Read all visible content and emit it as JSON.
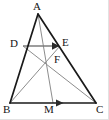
{
  "figure": {
    "type": "geometry-diagram",
    "shape": "triangle",
    "width": 109,
    "height": 120,
    "background_color": "#ffffff",
    "primary_stroke_color": "#1a1a1a",
    "secondary_stroke_color": "#8d8d8d",
    "frame_color": "#e2e2e2"
  },
  "labels": {
    "a": "A",
    "b": "B",
    "c": "C",
    "d": "D",
    "e": "E",
    "f": "F",
    "m": "M"
  },
  "points": {
    "A": {
      "x": 38,
      "y": 14,
      "label": "A",
      "label_x": 33,
      "label_y": 1
    },
    "B": {
      "x": 10,
      "y": 103,
      "label": "B",
      "label_x": 3,
      "label_y": 104
    },
    "C": {
      "x": 96,
      "y": 103,
      "label": "C",
      "label_x": 96,
      "label_y": 104
    },
    "D": {
      "x": 23,
      "y": 46,
      "label": "D",
      "label_x": 10,
      "label_y": 38
    },
    "E": {
      "x": 60,
      "y": 46,
      "label": "E",
      "label_x": 62,
      "label_y": 37
    },
    "F": {
      "x": 47,
      "y": 59,
      "label": "F",
      "label_x": 54,
      "label_y": 54
    },
    "M": {
      "x": 53,
      "y": 103,
      "label": "M",
      "label_x": 44,
      "label_y": 104
    }
  },
  "segments": [
    {
      "name": "side-AB",
      "from": "A",
      "to": "B",
      "style": "solid-dark",
      "width": 1.6
    },
    {
      "name": "side-AC",
      "from": "A",
      "to": "C",
      "style": "solid-dark",
      "width": 1.6
    },
    {
      "name": "side-BC",
      "from": "B",
      "to": "C",
      "style": "solid-dark",
      "width": 1.6
    },
    {
      "name": "segment-DE",
      "from": "D",
      "to": "E",
      "style": "solid-gray",
      "width": 1.2
    },
    {
      "name": "cevian-AM",
      "from": "A",
      "to": "M",
      "style": "solid-gray",
      "width": 1.0
    },
    {
      "name": "cevian-BE",
      "from": "B",
      "to": "E",
      "style": "solid-gray",
      "width": 1.0
    },
    {
      "name": "cevian-DC",
      "from": "D",
      "to": "C",
      "style": "solid-gray",
      "width": 1.0
    }
  ],
  "arrows": [
    {
      "name": "vector-DE-arrowhead",
      "on_segment": "segment-DE",
      "tip_x": 57,
      "tip_y": 46,
      "direction": "right"
    },
    {
      "name": "vector-BC-arrowhead",
      "on_segment": "side-BC",
      "tip_x": 62,
      "tip_y": 103,
      "direction": "right"
    }
  ]
}
